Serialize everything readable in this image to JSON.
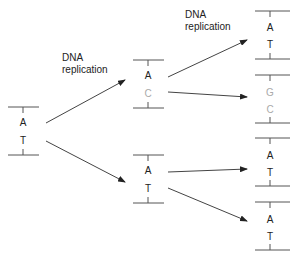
{
  "labels": {
    "step1": [
      "DNA",
      "replication"
    ],
    "step2": [
      "DNA",
      "replication"
    ]
  },
  "colors": {
    "original_strand": "#222222",
    "mutant_strand": "#aaaaaa",
    "line": "#555555"
  },
  "molecules": {
    "parent": {
      "top": "A",
      "bottom": "T"
    },
    "gen1_top": {
      "top": "A",
      "bottom": "C"
    },
    "gen1_bottom": {
      "top": "A",
      "bottom": "T"
    },
    "gen2_1": {
      "top": "A",
      "bottom": "T"
    },
    "gen2_2": {
      "top": "G",
      "bottom": "C"
    },
    "gen2_3": {
      "top": "A",
      "bottom": "T"
    },
    "gen2_4": {
      "top": "A",
      "bottom": "T"
    }
  }
}
